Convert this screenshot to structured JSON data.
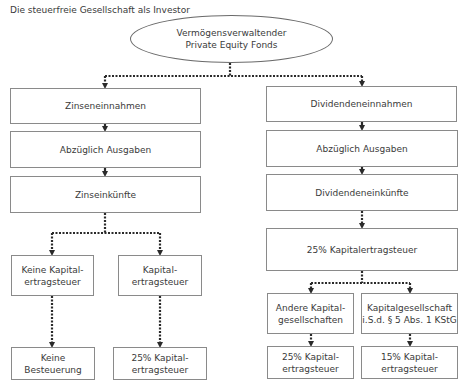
{
  "title": "Die steuerfreie Gesellschaft als Investor",
  "root": {
    "label": "Vermögensverwaltender\nPrivate Equity Fonds"
  },
  "left_branch": {
    "income": "Zinseneinnahmen",
    "expenses": "Abzüglich Ausgaben",
    "earnings": "Zinseinkünfte",
    "split": [
      {
        "label": "Keine Kapital-\nertragsteuer",
        "result": "Keine\nBesteuerung"
      },
      {
        "label": "Kapital-\nertragsteuer",
        "result": "25% Kapital-\nertragsteuer"
      }
    ]
  },
  "right_branch": {
    "income": "Dividendeneinnahmen",
    "expenses": "Abzüglich Ausgaben",
    "earnings": "Dividendeneinkünfte",
    "withholding": "25% Kapitalertragsteuer",
    "split": [
      {
        "label": "Andere Kapital-\ngesellschaften",
        "result": "25% Kapital-\nertragsteuer"
      },
      {
        "label": "Kapitalgesellschaft\ni.S.d. § 5 Abs. 1 KStG",
        "result": "15% Kapital-\nertragsteuer"
      }
    ]
  },
  "colors": {
    "border": "#8a8a8a",
    "connector": "#2a2a2a",
    "text": "#3a3a3a"
  }
}
